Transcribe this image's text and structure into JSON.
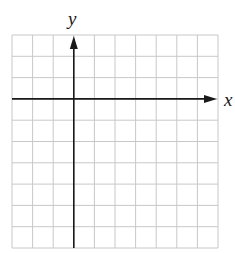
{
  "diagram": {
    "type": "coordinate-plane",
    "x_axis_label": "x",
    "y_axis_label": "y",
    "grid": {
      "columns": 10,
      "rows": 10,
      "left": 12,
      "top": 35,
      "right": 218,
      "bottom": 248,
      "line_color": "#c8c8c8",
      "line_width": 1
    },
    "axes": {
      "color": "#1a1a1a",
      "y_axis_x": 75,
      "x_axis_y": 99,
      "y_axis_column_index": 3,
      "x_axis_row_index": 3
    }
  }
}
